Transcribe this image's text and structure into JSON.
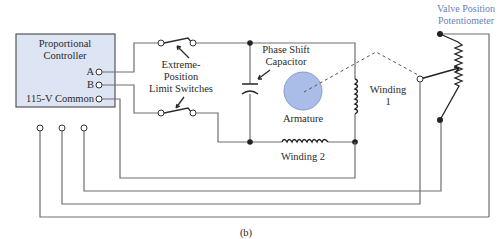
{
  "diagram": {
    "caption": "(b)",
    "controller": {
      "title_line1": "Proportional",
      "title_line2": "Controller",
      "terminal_a": "A",
      "terminal_b": "B",
      "terminal_common": "115-V Common",
      "fill_color": "#dde4f3"
    },
    "labels": {
      "limit_switches_line1": "Extreme-",
      "limit_switches_line2": "Position",
      "limit_switches_line3": "Limit Switches",
      "capacitor_line1": "Phase Shift",
      "capacitor_line2": "Capacitor",
      "armature": "Armature",
      "winding1_line1": "Winding",
      "winding1_line2": "1",
      "winding2": "Winding 2",
      "potentiometer_line1": "Valve Position",
      "potentiometer_line2": "Potentiometer"
    },
    "colors": {
      "armature_fill": "#a9bde8",
      "potentiometer_label": "#6a7fb8",
      "wire": "#6e6e6e"
    }
  }
}
